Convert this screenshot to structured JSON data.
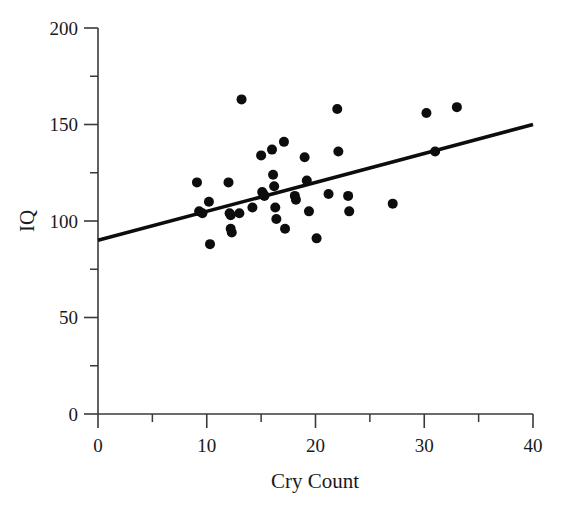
{
  "chart_data": {
    "type": "scatter",
    "title": "",
    "xlabel": "Cry Count",
    "ylabel": "IQ",
    "xlim": [
      0,
      40
    ],
    "ylim": [
      0,
      200
    ],
    "xticks": [
      0,
      10,
      20,
      30,
      40
    ],
    "xtick_labels": [
      "0",
      "10",
      "20",
      "30",
      "40"
    ],
    "xminor_ticks": [
      5,
      15,
      25,
      35
    ],
    "yticks": [
      0,
      50,
      100,
      150,
      200
    ],
    "ytick_labels": [
      "0",
      "50",
      "100",
      "150",
      "200"
    ],
    "yminor_ticks": [
      25,
      75,
      125,
      175
    ],
    "grid": false,
    "legend": null,
    "marker": "filled-circle",
    "marker_color": "#0d0d0d",
    "marker_size": 5,
    "points": [
      {
        "x": 9.1,
        "y": 120
      },
      {
        "x": 9.3,
        "y": 105
      },
      {
        "x": 9.6,
        "y": 104
      },
      {
        "x": 10.2,
        "y": 110
      },
      {
        "x": 10.3,
        "y": 88
      },
      {
        "x": 12.0,
        "y": 120
      },
      {
        "x": 12.1,
        "y": 104
      },
      {
        "x": 12.2,
        "y": 103
      },
      {
        "x": 12.2,
        "y": 96
      },
      {
        "x": 12.3,
        "y": 94
      },
      {
        "x": 13.0,
        "y": 104
      },
      {
        "x": 13.2,
        "y": 163
      },
      {
        "x": 14.2,
        "y": 107
      },
      {
        "x": 15.0,
        "y": 134
      },
      {
        "x": 15.1,
        "y": 115
      },
      {
        "x": 15.2,
        "y": 114
      },
      {
        "x": 15.3,
        "y": 113
      },
      {
        "x": 16.0,
        "y": 137
      },
      {
        "x": 16.1,
        "y": 124
      },
      {
        "x": 16.2,
        "y": 118
      },
      {
        "x": 16.3,
        "y": 107
      },
      {
        "x": 16.4,
        "y": 101
      },
      {
        "x": 17.1,
        "y": 141
      },
      {
        "x": 17.2,
        "y": 96
      },
      {
        "x": 18.1,
        "y": 113
      },
      {
        "x": 18.2,
        "y": 111
      },
      {
        "x": 19.0,
        "y": 133
      },
      {
        "x": 19.2,
        "y": 121
      },
      {
        "x": 19.4,
        "y": 105
      },
      {
        "x": 20.1,
        "y": 91
      },
      {
        "x": 21.2,
        "y": 114
      },
      {
        "x": 22.0,
        "y": 158
      },
      {
        "x": 22.1,
        "y": 136
      },
      {
        "x": 23.0,
        "y": 113
      },
      {
        "x": 23.1,
        "y": 105
      },
      {
        "x": 27.1,
        "y": 109
      },
      {
        "x": 30.2,
        "y": 156
      },
      {
        "x": 31.0,
        "y": 136
      },
      {
        "x": 33.0,
        "y": 159
      }
    ],
    "trend_line": {
      "label": "regression-line",
      "color": "#0d0d0d",
      "x_start": 0,
      "y_start": 90,
      "x_end": 40,
      "y_end": 150
    }
  },
  "colors": {
    "background": "#ffffff",
    "axis": "#3a3a3a",
    "ink": "#0d0d0d",
    "text": "#1a1a1a"
  }
}
